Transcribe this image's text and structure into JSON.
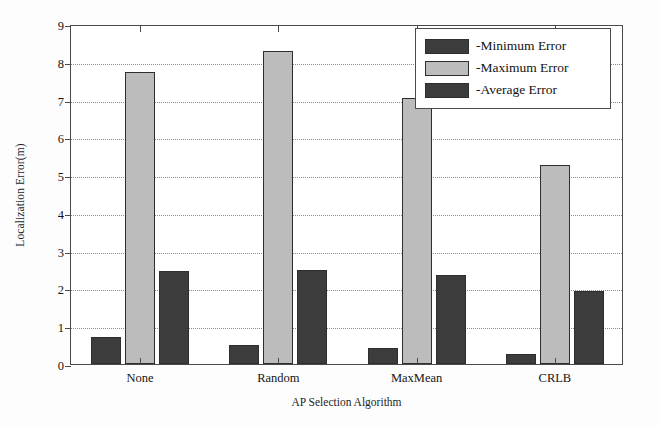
{
  "chart_data": {
    "type": "bar",
    "title": "",
    "xlabel": "AP Selection Algorithm",
    "ylabel": "Localization Error(m)",
    "categories": [
      "None",
      "Random",
      "MaxMean",
      "CRLB"
    ],
    "series": [
      {
        "name": "-Minimum Error",
        "color": "#3c3c3c",
        "values": [
          0.72,
          0.5,
          0.43,
          0.26
        ]
      },
      {
        "name": "-Maximum Error",
        "color": "#bcbcbc",
        "values": [
          7.72,
          8.28,
          7.05,
          5.28
        ]
      },
      {
        "name": "-Average Error",
        "color": "#3c3c3c",
        "values": [
          2.45,
          2.5,
          2.35,
          1.92
        ]
      }
    ],
    "ylim": [
      0,
      9
    ],
    "yticks": [
      "0",
      "1",
      "2",
      "3",
      "4",
      "5",
      "6",
      "7",
      "8",
      "9"
    ],
    "grid": "horizontal-dotted",
    "legend_position": "top-right"
  },
  "legend": {
    "items": [
      {
        "label": "-Minimum Error",
        "swatch": "min"
      },
      {
        "label": "-Maximum Error",
        "swatch": "max"
      },
      {
        "label": "-Average Error",
        "swatch": "avg"
      }
    ]
  }
}
